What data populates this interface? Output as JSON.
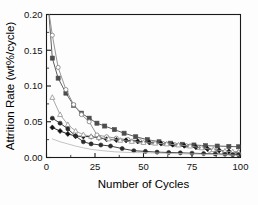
{
  "chart_data": {
    "type": "line",
    "title": "",
    "xlabel": "Number of Cycles",
    "ylabel": "Attrition Rate (wt%/cycle)",
    "xlim": [
      0,
      100
    ],
    "ylim": [
      0.0,
      0.2
    ],
    "xticks": [
      "0",
      "25",
      "50",
      "75",
      "100"
    ],
    "xtick_values": [
      0,
      25,
      50,
      75,
      100
    ],
    "yticks": [
      "0.00",
      "0.05",
      "0.10",
      "0.15",
      "0.20"
    ],
    "ytick_values": [
      0.0,
      0.05,
      0.1,
      0.15,
      0.2
    ],
    "grid": false,
    "legend_position": "upper right",
    "series": [
      {
        "name": "Cu13Al-C",
        "marker": "filled-square",
        "color": "#4d4d4d",
        "x": [
          3,
          6,
          10,
          14,
          18,
          22,
          26,
          30,
          35,
          40,
          46,
          52,
          58,
          64,
          70,
          76,
          82,
          88,
          94,
          99
        ],
        "y": [
          0.139,
          0.111,
          0.09,
          0.073,
          0.062,
          0.055,
          0.048,
          0.044,
          0.039,
          0.034,
          0.029,
          0.025,
          0.022,
          0.02,
          0.0185,
          0.0175,
          0.0165,
          0.016,
          0.0155,
          0.015
        ]
      },
      {
        "name": "Cu17Al-WI-550",
        "marker": "open-circle",
        "color": "#8a8a8a",
        "x": [
          3,
          6,
          10,
          14,
          18,
          22,
          26,
          31,
          36,
          42,
          48,
          54,
          60,
          66,
          72,
          78,
          84,
          90,
          95,
          99
        ],
        "y": [
          0.171,
          0.126,
          0.095,
          0.074,
          0.06,
          0.05,
          0.0315,
          0.029,
          0.027,
          0.025,
          0.023,
          0.021,
          0.0195,
          0.018,
          0.0165,
          0.014,
          0.01,
          0.007,
          0.0055,
          0.005
        ]
      },
      {
        "name": "Cu10Al-WI-950",
        "marker": "filled-diamond",
        "color": "#111111",
        "x": [
          3,
          7,
          11,
          15,
          19,
          23,
          27,
          31,
          36,
          41,
          47,
          53,
          59,
          65,
          71,
          77,
          83,
          89,
          94,
          99
        ],
        "y": [
          0.042,
          0.037,
          0.033,
          0.03,
          0.0295,
          0.029,
          0.0275,
          0.0255,
          0.0245,
          0.024,
          0.0225,
          0.021,
          0.0195,
          0.018,
          0.0165,
          0.0145,
          0.012,
          0.01,
          0.0085,
          0.007
        ]
      },
      {
        "name": "Cu15Al-DI-550",
        "marker": "open-triangle",
        "color": "#9d9d9d",
        "x": [
          3,
          7,
          11,
          15,
          19,
          23,
          27,
          32,
          38,
          44,
          50,
          56,
          62,
          68,
          74,
          80,
          86,
          92,
          96,
          99
        ],
        "y": [
          0.084,
          0.06,
          0.046,
          0.037,
          0.032,
          0.0295,
          0.028,
          0.026,
          0.024,
          0.0225,
          0.021,
          0.02,
          0.019,
          0.0175,
          0.016,
          0.0135,
          0.011,
          0.009,
          0.008,
          0.0075
        ]
      },
      {
        "name": "Cu15Al-DI-850",
        "marker": "filled-circle",
        "color": "#2b2b2b",
        "x": [
          3,
          7,
          11,
          15,
          19,
          23,
          28,
          33,
          39,
          45,
          51,
          57,
          63,
          69,
          75,
          81,
          87,
          92,
          96,
          99
        ],
        "y": [
          0.055,
          0.048,
          0.04,
          0.03,
          0.022,
          0.019,
          0.0175,
          0.016,
          0.0125,
          0.0095,
          0.0085,
          0.0075,
          0.007,
          0.0065,
          0.006,
          0.0055,
          0.005,
          0.0045,
          0.004,
          0.004
        ]
      },
      {
        "name": "Cu10Al-DI-950",
        "marker": "none",
        "color": "#bcbcbc",
        "x": [
          3,
          7,
          11,
          15,
          19,
          24,
          29,
          35,
          41,
          47,
          53,
          60,
          67,
          74,
          81,
          88,
          94,
          99
        ],
        "y": [
          0.026,
          0.022,
          0.019,
          0.016,
          0.0135,
          0.011,
          0.0095,
          0.008,
          0.0072,
          0.0068,
          0.0065,
          0.006,
          0.0055,
          0.005,
          0.0045,
          0.004,
          0.0035,
          0.003
        ]
      }
    ]
  }
}
